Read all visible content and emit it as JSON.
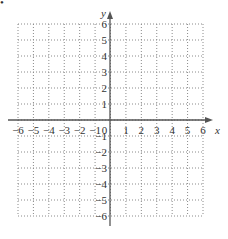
{
  "figure": {
    "marker": "•",
    "type": "coordinate-grid",
    "x_axis": {
      "label": "x",
      "min": -6,
      "max": 6,
      "ticks": [
        "-6",
        "-5",
        "-4",
        "-3",
        "-2",
        "-1",
        "0",
        "1",
        "2",
        "3",
        "4",
        "5",
        "6"
      ]
    },
    "y_axis": {
      "label": "y",
      "min": -6,
      "max": 6,
      "ticks_positive": [
        "1",
        "2",
        "3",
        "4",
        "5",
        "6"
      ],
      "ticks_negative": [
        "-1",
        "-2",
        "-3",
        "-4",
        "-5",
        "-6"
      ]
    },
    "grid": {
      "style": "dotted",
      "color": "#8a8a8a"
    },
    "axis_color": "#555555"
  }
}
